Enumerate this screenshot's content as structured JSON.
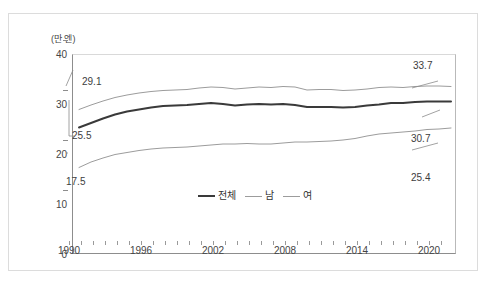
{
  "figure": {
    "top_clipped_text": "",
    "bottom_clipped_text": "",
    "y_unit_caption": "(만 엔)"
  },
  "chart_data": {
    "type": "line",
    "title": "",
    "xlabel": "",
    "ylabel": "(만 엔)",
    "ylim": [
      0,
      40
    ],
    "xlim": [
      1990,
      2021
    ],
    "yticks": [
      0,
      10,
      20,
      30,
      40
    ],
    "xticks": [
      1990,
      1996,
      2002,
      2008,
      2014,
      2020
    ],
    "grid": false,
    "legend_position": "bottom-center",
    "x": [
      1990,
      1991,
      1992,
      1993,
      1994,
      1995,
      1996,
      1997,
      1998,
      1999,
      2000,
      2001,
      2002,
      2003,
      2004,
      2005,
      2006,
      2007,
      2008,
      2009,
      2010,
      2011,
      2012,
      2013,
      2014,
      2015,
      2016,
      2017,
      2018,
      2019,
      2020,
      2021
    ],
    "series": [
      {
        "name": "전체",
        "color": "#3a3a3a",
        "width": 2.0,
        "values": [
          25.5,
          26.4,
          27.3,
          28.1,
          28.7,
          29.1,
          29.5,
          29.8,
          29.9,
          30.0,
          30.2,
          30.4,
          30.2,
          29.9,
          30.1,
          30.2,
          30.1,
          30.2,
          30.0,
          29.6,
          29.6,
          29.6,
          29.5,
          29.6,
          29.9,
          30.1,
          30.4,
          30.4,
          30.6,
          30.7,
          30.7,
          30.7
        ],
        "start_label": "25.5",
        "end_label": "30.7"
      },
      {
        "name": "남",
        "color": "#9c9c9c",
        "width": 1.0,
        "values": [
          29.1,
          30.0,
          30.8,
          31.5,
          32.0,
          32.4,
          32.7,
          32.9,
          33.0,
          33.1,
          33.4,
          33.6,
          33.5,
          33.2,
          33.4,
          33.6,
          33.5,
          33.7,
          33.6,
          33.0,
          33.1,
          33.1,
          32.9,
          33.0,
          33.2,
          33.5,
          33.6,
          33.5,
          33.7,
          33.8,
          33.8,
          33.7
        ],
        "start_label": "29.1",
        "end_label": "33.7"
      },
      {
        "name": "여",
        "color": "#9c9c9c",
        "width": 1.0,
        "values": [
          17.5,
          18.6,
          19.4,
          20.1,
          20.5,
          20.9,
          21.2,
          21.4,
          21.5,
          21.6,
          21.8,
          22.0,
          22.2,
          22.2,
          22.3,
          22.2,
          22.2,
          22.4,
          22.6,
          22.6,
          22.7,
          22.8,
          23.0,
          23.3,
          23.8,
          24.2,
          24.4,
          24.6,
          24.8,
          25.1,
          25.2,
          25.4
        ],
        "start_label": "17.5",
        "end_label": "25.4"
      }
    ],
    "annotations": [
      {
        "text": "29.1",
        "series": "남",
        "position": "start"
      },
      {
        "text": "25.5",
        "series": "전체",
        "position": "start"
      },
      {
        "text": "17.5",
        "series": "여",
        "position": "start"
      },
      {
        "text": "33.7",
        "series": "남",
        "position": "end"
      },
      {
        "text": "30.7",
        "series": "전체",
        "position": "end"
      },
      {
        "text": "25.4",
        "series": "여",
        "position": "end"
      }
    ]
  }
}
